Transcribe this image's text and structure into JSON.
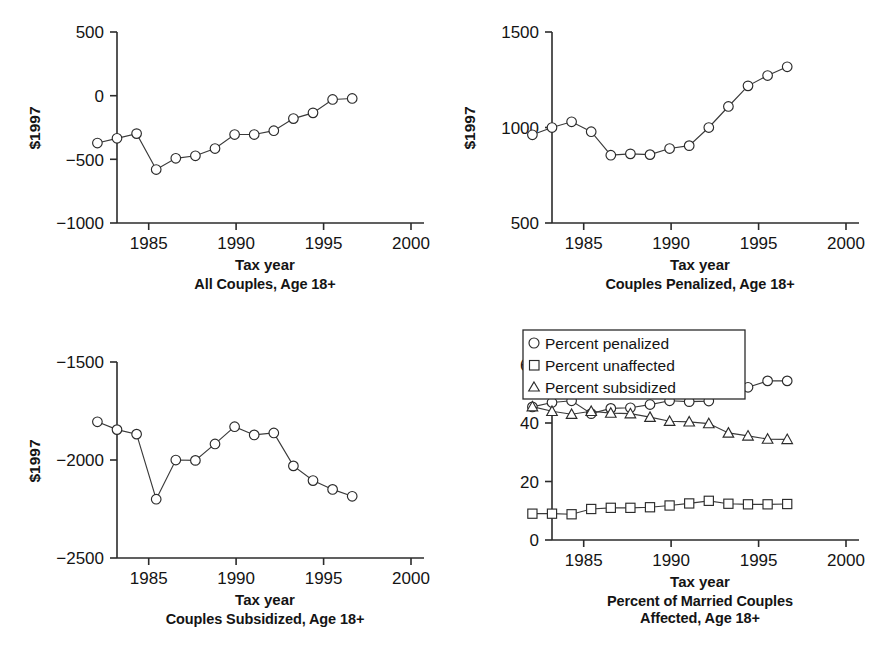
{
  "figure": {
    "shared_xlabel": "Tax year",
    "shared_ylabel_currency": "$1997",
    "xlim": [
      1983.2,
      2000.8
    ],
    "xticks": [
      1985,
      1990,
      1995,
      2000
    ],
    "xticklabels": [
      "1985",
      "1990",
      "1995",
      "2000"
    ]
  },
  "chart_data": [
    {
      "id": "all-couples",
      "type": "line",
      "title": "All Couples, Age 18+",
      "xlabel": "Tax year",
      "ylabel": "$1997",
      "ylim": [
        -1000,
        500
      ],
      "yticks": [
        -1000,
        -500,
        0,
        500
      ],
      "yticklabels": [
        "−1000",
        "−500",
        "0",
        "500"
      ],
      "grid": false,
      "legend": null,
      "marker": "circle",
      "x": [
        1984,
        1985,
        1986,
        1987,
        1988,
        1989,
        1990,
        1991,
        1992,
        1993,
        1994,
        1995,
        1996,
        1997
      ],
      "values": [
        -372,
        -335,
        -298,
        -580,
        -492,
        -472,
        -415,
        -305,
        -305,
        -275,
        -180,
        -135,
        -30,
        -22
      ]
    },
    {
      "id": "couples-penalized",
      "type": "line",
      "title": "Couples Penalized, Age 18+",
      "xlabel": "Tax year",
      "ylabel": "$1997",
      "ylim": [
        500,
        1500
      ],
      "yticks": [
        500,
        1000,
        1500
      ],
      "yticklabels": [
        "500",
        "1000",
        "1500"
      ],
      "grid": false,
      "legend": null,
      "marker": "circle",
      "x": [
        1984,
        1985,
        1986,
        1987,
        1988,
        1989,
        1990,
        1991,
        1992,
        1993,
        1994,
        1995,
        1996,
        1997
      ],
      "values": [
        962,
        1000,
        1030,
        978,
        855,
        862,
        858,
        890,
        905,
        1000,
        1110,
        1218,
        1272,
        1318
      ]
    },
    {
      "id": "couples-subsidized",
      "type": "line",
      "title": "Couples Subsidized, Age 18+",
      "xlabel": "Tax year",
      "ylabel": "$1997",
      "ylim": [
        -2500,
        -1500
      ],
      "yticks": [
        -2500,
        -2000,
        -1500
      ],
      "yticklabels": [
        "−2500",
        "−2000",
        "−1500"
      ],
      "grid": false,
      "legend": null,
      "marker": "circle",
      "x": [
        1984,
        1985,
        1986,
        1987,
        1988,
        1989,
        1990,
        1991,
        1992,
        1993,
        1994,
        1995,
        1996,
        1997
      ],
      "values": [
        -1805,
        -1845,
        -1868,
        -2200,
        -2000,
        -2002,
        -1918,
        -1830,
        -1872,
        -1862,
        -2030,
        -2105,
        -2150,
        -2185
      ]
    },
    {
      "id": "percent-affected",
      "type": "line",
      "title": "Percent of Married Couples\nAffected, Age 18+",
      "xlabel": "Tax year",
      "ylabel": "",
      "ylim": [
        0,
        66
      ],
      "yticks": [
        0,
        20,
        40,
        60
      ],
      "yticklabels": [
        "0",
        "20",
        "40",
        "60"
      ],
      "grid": false,
      "legend": {
        "position": "top-left",
        "entries": [
          {
            "label": "Percent penalized",
            "marker": "circle"
          },
          {
            "label": "Percent unaffected",
            "marker": "square"
          },
          {
            "label": "Percent subsidized",
            "marker": "triangle"
          }
        ]
      },
      "x": [
        1984,
        1985,
        1986,
        1987,
        1988,
        1989,
        1990,
        1991,
        1992,
        1993,
        1994,
        1995,
        1996,
        1997
      ],
      "series": [
        {
          "name": "Percent penalized",
          "marker": "circle",
          "values": [
            45.5,
            47.0,
            47.6,
            43.2,
            45.0,
            45.2,
            46.3,
            47.6,
            47.3,
            47.5,
            50.8,
            52.2,
            54.4,
            54.4
          ]
        },
        {
          "name": "Percent unaffected",
          "marker": "square",
          "values": [
            9.0,
            9.0,
            8.8,
            10.6,
            11.0,
            11.0,
            11.2,
            11.8,
            12.5,
            13.4,
            12.4,
            12.2,
            12.2,
            12.3
          ]
        },
        {
          "name": "Percent subsidized",
          "marker": "triangle",
          "values": [
            45.6,
            44.0,
            43.0,
            44.0,
            43.4,
            43.2,
            42.0,
            40.6,
            40.4,
            39.8,
            36.6,
            35.6,
            34.5,
            34.4
          ]
        }
      ]
    }
  ]
}
